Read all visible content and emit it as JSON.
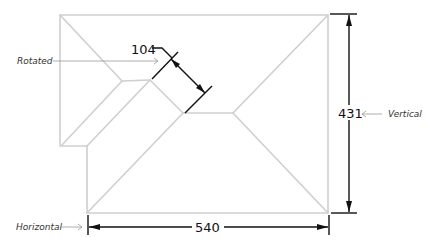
{
  "drawing": {
    "type": "roof-plan-dimensions",
    "colors": {
      "roof_lines": "#cfcfcf",
      "dimension_lines": "#111111",
      "leader_lines": "#9a9a9a"
    }
  },
  "dimensions": {
    "rotated": {
      "value": "104",
      "label": "Rotated"
    },
    "vertical": {
      "value": "431",
      "label": "Vertical"
    },
    "horizontal": {
      "value": "540",
      "label": "Horizontal"
    }
  }
}
